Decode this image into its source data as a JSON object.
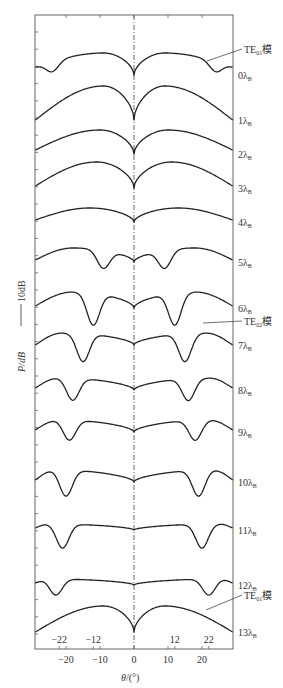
{
  "chart_data": {
    "type": "line",
    "title": "",
    "xlabel": "θ/(°)",
    "ylabel": "P/dB",
    "scale_bar": "10dB",
    "xlim": [
      -29,
      29
    ],
    "x_ticks": [
      -20,
      -10,
      0,
      10,
      20
    ],
    "x_tick_labels": [
      "−20",
      "−10",
      "0",
      "10",
      "20"
    ],
    "inner_markers": [
      -22,
      -12,
      12,
      22
    ],
    "inner_marker_labels": [
      "−22",
      "−12",
      "12",
      "22"
    ],
    "grid": false,
    "center_line": "dash-dot at θ=0",
    "offset_note": "Curves stacked vertically, each offset by one step; units arbitrary dB",
    "series": [
      {
        "name": "0λB",
        "label": "0λ",
        "sub": "B",
        "baseline_y": 75,
        "peak_deg": 9,
        "peak_h": 22,
        "edge_h": 8,
        "side_nulls": [
          -24,
          24
        ],
        "null_depth": 10
      },
      {
        "name": "1λB",
        "label": "1λ",
        "sub": "B",
        "baseline_y": 120,
        "peak_deg": 9,
        "peak_h": 34,
        "edge_h": 0,
        "side_nulls": [],
        "null_depth": 0
      },
      {
        "name": "2λB",
        "label": "2λ",
        "sub": "B",
        "baseline_y": 154,
        "peak_deg": 10,
        "peak_h": 24,
        "edge_h": 4,
        "side_nulls": [],
        "null_depth": 0
      },
      {
        "name": "3λB",
        "label": "3λ",
        "sub": "B",
        "baseline_y": 188,
        "peak_deg": 11,
        "peak_h": 26,
        "edge_h": 2,
        "side_nulls": [],
        "null_depth": 0
      },
      {
        "name": "4λB",
        "label": "4λ",
        "sub": "B",
        "baseline_y": 222,
        "peak_deg": 13,
        "peak_h": 14,
        "edge_h": 2,
        "side_nulls": [],
        "null_depth": 0
      },
      {
        "name": "5λB",
        "label": "5λ",
        "sub": "B",
        "baseline_y": 262,
        "peak_deg": 18,
        "peak_h": 14,
        "edge_h": 2,
        "side_nulls": [
          -9,
          9
        ],
        "null_depth": 18
      },
      {
        "name": "6λB",
        "label": "6λ",
        "sub": "B",
        "baseline_y": 308,
        "peak_deg": 18,
        "peak_h": 16,
        "edge_h": 2,
        "side_nulls": [
          -12,
          12
        ],
        "null_depth": 32
      },
      {
        "name": "7λB",
        "label": "7λ",
        "sub": "B",
        "baseline_y": 345,
        "peak_deg": 21,
        "peak_h": 12,
        "edge_h": 0,
        "side_nulls": [
          -15,
          15
        ],
        "null_depth": 28
      },
      {
        "name": "8λB",
        "label": "8λ",
        "sub": "B",
        "baseline_y": 390,
        "peak_deg": 22,
        "peak_h": 12,
        "edge_h": 2,
        "side_nulls": [
          -18,
          16
        ],
        "null_depth": 22
      },
      {
        "name": "9λB",
        "label": "9λ",
        "sub": "B",
        "baseline_y": 432,
        "peak_deg": 22,
        "peak_h": 12,
        "edge_h": 2,
        "side_nulls": [
          -19,
          18
        ],
        "null_depth": 20
      },
      {
        "name": "10λB",
        "label": "10λ",
        "sub": "B",
        "baseline_y": 482,
        "peak_deg": 23,
        "peak_h": 12,
        "edge_h": 2,
        "side_nulls": [
          -20,
          19
        ],
        "null_depth": 26
      },
      {
        "name": "11λB",
        "label": "11λ",
        "sub": "B",
        "baseline_y": 530,
        "peak_deg": 25,
        "peak_h": 6,
        "edge_h": 2,
        "side_nulls": [
          -21,
          20
        ],
        "null_depth": 24
      },
      {
        "name": "12λB",
        "label": "12λ",
        "sub": "B",
        "baseline_y": 585,
        "peak_deg": 25,
        "peak_h": 6,
        "edge_h": 2,
        "side_nulls": [
          -23,
          22
        ],
        "null_depth": 16
      },
      {
        "name": "13λB",
        "label": "13λ",
        "sub": "B",
        "baseline_y": 632,
        "peak_deg": 9,
        "peak_h": 26,
        "edge_h": 0,
        "side_nulls": [],
        "null_depth": 0
      }
    ],
    "annotations": [
      {
        "text": "TE",
        "sub": "01",
        "suffix": "模",
        "x": 244,
        "y": 53,
        "leader_from": [
          207,
          61
        ]
      },
      {
        "text": "TE",
        "sub": "02",
        "suffix": "模",
        "x": 244,
        "y": 325,
        "leader_from": [
          203,
          323
        ]
      },
      {
        "text": "TE",
        "sub": "01",
        "suffix": "模",
        "x": 244,
        "y": 599,
        "leader_from": [
          206,
          610
        ]
      }
    ]
  },
  "labels": {
    "xlabel_theta": "θ",
    "xlabel_unit": "/(°)",
    "ylabel": "P/dB",
    "scale_bar_text": "10dB"
  }
}
